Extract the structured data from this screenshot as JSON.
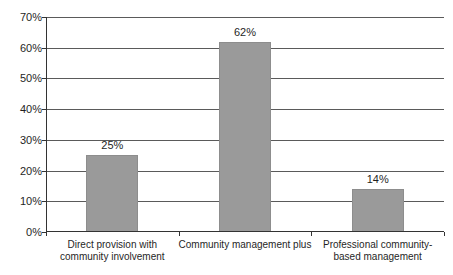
{
  "chart_data": {
    "type": "bar",
    "title": "",
    "xlabel": "",
    "ylabel": "",
    "categories": [
      "Direct provision with community involvement",
      "Community management plus",
      "Professional community-based management"
    ],
    "category_label_lines": [
      [
        "Direct provision with",
        "community involvement"
      ],
      [
        "Community management plus"
      ],
      [
        "Professional community-",
        "based management"
      ]
    ],
    "values": [
      25,
      62,
      14
    ],
    "data_labels": [
      "25%",
      "62%",
      "14%"
    ],
    "ylim": [
      0,
      70
    ],
    "ytick_step": 10,
    "ytick_labels": [
      "0%",
      "10%",
      "20%",
      "30%",
      "40%",
      "50%",
      "60%",
      "70%"
    ],
    "grid": true,
    "legend": "none",
    "colors": {
      "bar_fill": "#9a9a9a",
      "bar_edge": "#8d8d8d",
      "gridline": "#5a5a5a",
      "axis": "#333333",
      "text": "#1f1f1f",
      "background": "#ffffff"
    }
  }
}
